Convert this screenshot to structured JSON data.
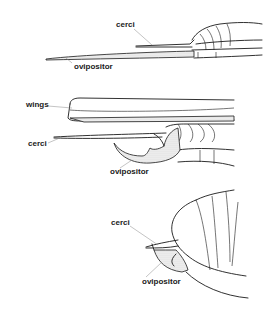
{
  "figure": {
    "panels": [
      {
        "id": "top",
        "labels": [
          {
            "text": "cerci",
            "x": 116,
            "y": 25
          },
          {
            "text": "ovipositor",
            "x": 74,
            "y": 67
          }
        ]
      },
      {
        "id": "middle",
        "labels": [
          {
            "text": "wings",
            "x": 26,
            "y": 104
          },
          {
            "text": "cerci",
            "x": 28,
            "y": 143
          },
          {
            "text": "ovipositor",
            "x": 110,
            "y": 172
          }
        ]
      },
      {
        "id": "bottom",
        "labels": [
          {
            "text": "cerci",
            "x": 111,
            "y": 222
          },
          {
            "text": "ovipositor",
            "x": 142,
            "y": 281
          }
        ]
      }
    ]
  },
  "colors": {
    "ink": "#1a1a1a",
    "leader": "#888888",
    "background": "#ffffff"
  }
}
